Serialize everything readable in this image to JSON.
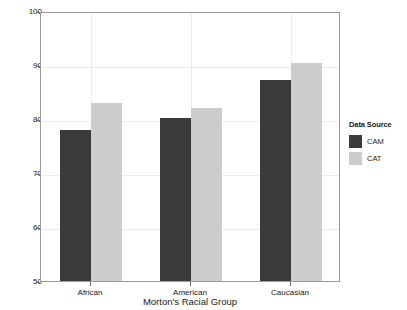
{
  "chart_data": {
    "type": "bar",
    "title": "",
    "xlabel": "Morton's Racial Group",
    "ylabel": "Average Cranial Capacity in Cubic Inches",
    "categories": [
      "African",
      "American",
      "Caucasian"
    ],
    "series": [
      {
        "name": "CAM",
        "color": "#3b3b3b",
        "values": [
          78.0,
          80.2,
          87.3
        ]
      },
      {
        "name": "CAT",
        "color": "#cccccc",
        "values": [
          83.0,
          82.1,
          90.4
        ]
      }
    ],
    "ylim": [
      50,
      100
    ],
    "yticks": [
      50,
      60,
      70,
      80,
      90,
      100
    ],
    "ytick_labels": [
      "50",
      "60",
      "70",
      "80",
      "90",
      "100"
    ],
    "grid": "horizontal-and-vertical-light",
    "legend": {
      "title": "Data Source",
      "position": "right",
      "entries": [
        {
          "label": "CAM",
          "color": "#3b3b3b"
        },
        {
          "label": "CAT",
          "color": "#cccccc"
        }
      ]
    }
  }
}
